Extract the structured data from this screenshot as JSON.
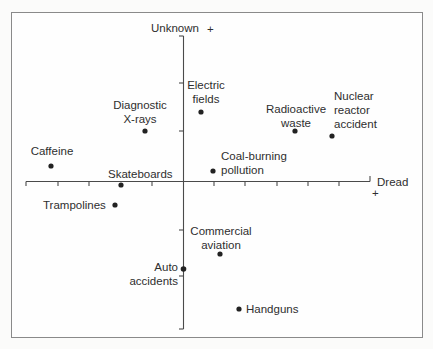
{
  "diagram": {
    "axes": {
      "y_top_label": "Unknown",
      "y_top_sign": "+",
      "x_right_label": "Dread",
      "x_right_sign": "+"
    },
    "points": [
      {
        "id": "caffeine",
        "label": "Caffeine",
        "lines": [
          "Caffeine"
        ]
      },
      {
        "id": "diagnostic-xrays",
        "label": "Diagnostic X-rays",
        "lines": [
          "Diagnostic",
          "X-rays"
        ]
      },
      {
        "id": "electric-fields",
        "label": "Electric fields",
        "lines": [
          "Electric",
          "fields"
        ]
      },
      {
        "id": "radioactive-waste",
        "label": "Radioactive waste",
        "lines": [
          "Radioactive",
          "waste"
        ]
      },
      {
        "id": "nuclear-reactor-accident",
        "label": "Nuclear reactor accident",
        "lines": [
          "Nuclear",
          "reactor",
          "accident"
        ]
      },
      {
        "id": "skateboards",
        "label": "Skateboards",
        "lines": [
          "Skateboards"
        ]
      },
      {
        "id": "coal-burning-pollution",
        "label": "Coal-burning pollution",
        "lines": [
          "Coal-burning",
          "pollution"
        ]
      },
      {
        "id": "trampolines",
        "label": "Trampolines",
        "lines": [
          "Trampolines"
        ]
      },
      {
        "id": "commercial-aviation",
        "label": "Commercial aviation",
        "lines": [
          "Commercial",
          "aviation"
        ]
      },
      {
        "id": "auto-accidents",
        "label": "Auto accidents",
        "lines": [
          "Auto",
          "accidents"
        ]
      },
      {
        "id": "handguns",
        "label": "Handguns",
        "lines": [
          "Handguns"
        ]
      }
    ],
    "colors": {
      "ink": "#2e2e2e",
      "axis": "#555555",
      "frame": "#8a8a8a",
      "background": "#fefefe"
    }
  }
}
